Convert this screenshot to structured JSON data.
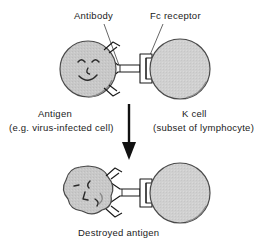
{
  "figure": {
    "background_color": "#ffffff",
    "stroke_color": "#1a1a1a",
    "antigen_fill": "#c8c8c8",
    "kcell_fill": "#d0d0d0",
    "text_color": "#1a1a1a"
  },
  "labels": {
    "antibody": "Antibody",
    "fc_receptor": "Fc receptor",
    "antigen": "Antigen",
    "antigen_sub": "(e.g. virus-infected cell)",
    "k_cell": "K  cell",
    "k_cell_sub": "(subset of lymphocyte)",
    "destroyed_antigen": "Destroyed antigen"
  },
  "shapes": {
    "top_antigen": "circle-smiley-face",
    "top_k_cell": "circle-plain",
    "bottom_antigen": "irregular-blob-distorted-face",
    "bottom_k_cell": "circle-plain",
    "antibody_connector": "y-shaped-antibody",
    "fc_receptor_connector": "i-beam-bracket",
    "process_arrow": "down-arrow"
  }
}
